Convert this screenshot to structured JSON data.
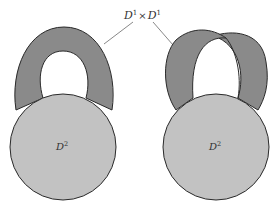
{
  "diagram": {
    "top_label": {
      "base1": "D",
      "exp1": "1",
      "times": "×",
      "base2": "D",
      "exp2": "1"
    },
    "left": {
      "disk_label": {
        "base": "D",
        "exp": "2"
      },
      "handle_type": "untwisted band (annulus)"
    },
    "right": {
      "disk_label": {
        "base": "D",
        "exp": "2"
      },
      "handle_type": "twisted band (Möbius)"
    },
    "colors": {
      "disk_fill": "#c2c2c2",
      "band_fill": "#8a8a8a",
      "stroke": "#2a2a2a",
      "leader_line": "#6a6a6a",
      "background": "#ffffff"
    }
  }
}
